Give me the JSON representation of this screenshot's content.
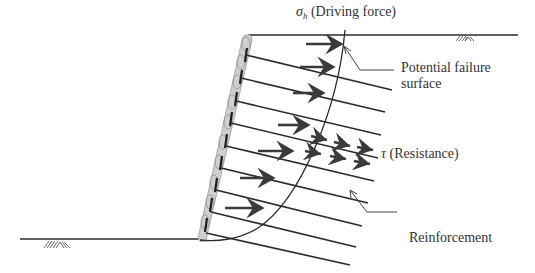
{
  "diagram": {
    "labels": {
      "driving_symbol": "σ",
      "driving_subscript": "h",
      "driving_text": " (Driving force)",
      "failure_line1": "Potential failure",
      "failure_line2": "surface",
      "resistance_symbol": "τ",
      "resistance_text": " (Resistance)",
      "reinforcement": "Reinforcement"
    },
    "colors": {
      "line": "#2b2b2b",
      "arrow": "#3a3a3a",
      "wall_fill": "#c9c9c9",
      "text": "#333333"
    },
    "elements": {
      "top_ground": {
        "x1": 248,
        "y1": 35,
        "x2": 518,
        "y2": 35
      },
      "bottom_ground": {
        "x1": 20,
        "y1": 239,
        "x2": 200,
        "y2": 239
      },
      "wall_face": {
        "top": [
          248,
          35
        ],
        "bottom": [
          200,
          239
        ]
      },
      "reinforcement_count": 9,
      "driving_arrows_count": 7,
      "resistance_arrows_count": 6
    }
  }
}
